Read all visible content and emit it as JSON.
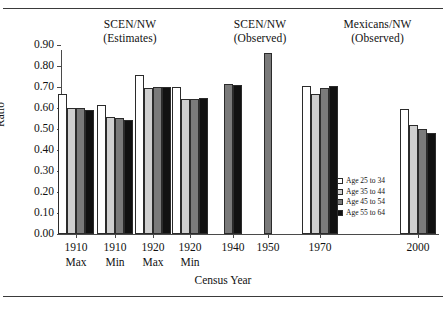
{
  "figure": {
    "top_rule": "",
    "bottom_rule": ""
  },
  "panels": [
    {
      "line1": "SCEN/NW",
      "line2": "(Estimates)"
    },
    {
      "line1": "SCEN/NW",
      "line2": "(Observed)"
    },
    {
      "line1": "Mexicans/NW",
      "line2": "(Observed)"
    }
  ],
  "chart_data": {
    "type": "bar",
    "title": "",
    "xlabel": "Census Year",
    "ylabel": "Ratio",
    "ylim": [
      0.0,
      0.9
    ],
    "ytick_labels": [
      "0.00",
      "0.10",
      "0.20",
      "0.30",
      "0.40",
      "0.50",
      "0.60",
      "0.70",
      "0.80",
      "0.90"
    ],
    "ytick_values": [
      0.0,
      0.1,
      0.2,
      0.3,
      0.4,
      0.5,
      0.6,
      0.7,
      0.8,
      0.9
    ],
    "grid": false,
    "legend_position": "inside-right",
    "categories": [
      "1910 Max",
      "1910 Min",
      "1920 Max",
      "1920 Min",
      "1940",
      "1950",
      "1970",
      "2000"
    ],
    "category_labels": [
      {
        "line1": "1910",
        "line2": "Max"
      },
      {
        "line1": "1910",
        "line2": "Min"
      },
      {
        "line1": "1920",
        "line2": "Max"
      },
      {
        "line1": "1920",
        "line2": "Min"
      },
      {
        "line1": "1940",
        "line2": ""
      },
      {
        "line1": "1950",
        "line2": ""
      },
      {
        "line1": "1970",
        "line2": ""
      },
      {
        "line1": "2000",
        "line2": ""
      }
    ],
    "series": [
      {
        "name": "Age 25 to 34",
        "color": "#ffffff",
        "values": [
          0.665,
          0.615,
          0.757,
          0.7,
          null,
          null,
          0.707,
          0.597
        ]
      },
      {
        "name": "Age 35 to 44",
        "color": "#cfcfcf",
        "values": [
          0.601,
          0.557,
          0.697,
          0.643,
          null,
          null,
          0.665,
          0.521
        ]
      },
      {
        "name": "Age 45 to 54",
        "color": "#7a7a7a",
        "values": [
          0.6,
          0.553,
          0.7,
          0.641,
          0.712,
          0.86,
          0.697,
          0.498
        ]
      },
      {
        "name": "Age 55 to 64",
        "color": "#111111",
        "values": [
          0.59,
          0.542,
          0.7,
          0.647,
          0.71,
          null,
          0.705,
          0.482
        ]
      }
    ]
  },
  "legend": {
    "items": [
      {
        "label": "Age 25 to 34",
        "color": "#ffffff"
      },
      {
        "label": "Age 35 to 44",
        "color": "#cfcfcf"
      },
      {
        "label": "Age 45 to 54",
        "color": "#7a7a7a"
      },
      {
        "label": "Age 55 to 64",
        "color": "#111111"
      }
    ]
  }
}
